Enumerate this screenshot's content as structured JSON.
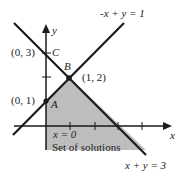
{
  "diagram": {
    "lines": [
      {
        "equation": "-x + y = 1"
      },
      {
        "equation": "x + y = 3"
      }
    ],
    "axes": {
      "x_label": "x",
      "y_label": "y"
    },
    "points": [
      {
        "name": "A",
        "coords": "(0, 1)"
      },
      {
        "name": "B",
        "coords": "(1, 2)"
      },
      {
        "name": "C",
        "coords": "(0, 3)"
      }
    ],
    "boundary_label": "x = 0",
    "region_label": "Set of solutions",
    "colors": {
      "shade": "#bdbdbd",
      "line": "#1a1a1a"
    }
  }
}
